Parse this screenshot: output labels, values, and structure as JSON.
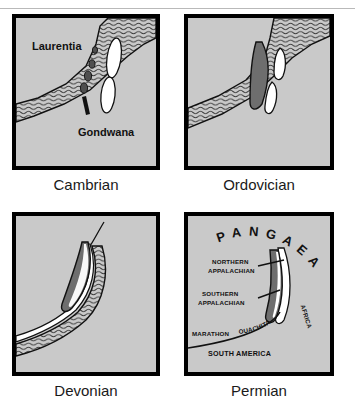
{
  "header": {
    "running_head": "THE APPALACHIAN PROVINCE"
  },
  "figure": {
    "type": "paleogeographic-map-series",
    "layout": "2x2-grid",
    "panel_count": 4
  },
  "palette": {
    "land": "#c9c9c9",
    "border": "#000000",
    "mountain_belt": "#6e6e6e",
    "arc_terrane": "#5a5a5a",
    "basin_white": "#ffffff",
    "ocean_hatch_line": "#3a3a3a",
    "page_background": "#ffffff",
    "caption_text": "#1a1a1a"
  },
  "panels": [
    {
      "id": "cambrian",
      "caption": "Cambrian",
      "labels": {
        "laurentia": "Laurentia",
        "gondwana": "Gondwana"
      },
      "features": [
        "ocean-basin-hatched",
        "island-arc-fragments",
        "rifted-basins"
      ]
    },
    {
      "id": "ordovician",
      "caption": "Ordovician",
      "labels": {},
      "features": [
        "ocean-basin-hatched",
        "accreted-terrane-belt",
        "remnant-basins"
      ]
    },
    {
      "id": "devonian",
      "caption": "Devonian",
      "labels": {},
      "features": [
        "collisional-mountain-belt",
        "foreland-basin-hatched"
      ]
    },
    {
      "id": "permian",
      "caption": "Permian",
      "labels": {
        "supercontinent": "PANGAEA",
        "northern_appalachian": "NORTHERN\nAPPALACHIAN",
        "northern_appalachian_line1": "NORTHERN",
        "northern_appalachian_line2": "APPALACHIAN",
        "southern_appalachian_line1": "SOUTHERN",
        "southern_appalachian_line2": "APPALACHIAN",
        "marathon": "MARATHON",
        "ouachita": "OUACHITA",
        "africa": "AFRICA",
        "south_america": "SOUTH AMERICA"
      },
      "features": [
        "pangaea-assembly",
        "appalachian-orogen",
        "ouachita-marathon-belt"
      ]
    }
  ]
}
